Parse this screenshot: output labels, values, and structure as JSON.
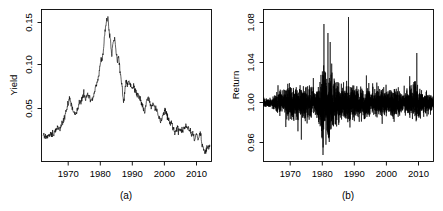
{
  "figure": {
    "background": "#ffffff",
    "line_color": "#000000",
    "panel_count": 2
  },
  "chart_data": [
    {
      "type": "line",
      "panel_id": "a",
      "caption": "(a)",
      "title": "",
      "xlabel": "",
      "ylabel": "Yield",
      "xlim": [
        1961.5,
        2014.5
      ],
      "ylim": [
        0.0145,
        0.1625
      ],
      "xticks": [
        1970,
        1980,
        1990,
        2000,
        2010
      ],
      "xticklabels": [
        "1970",
        "1980",
        "1990",
        "2000",
        "2010"
      ],
      "yticks": [
        0.05,
        0.1,
        0.15
      ],
      "yticklabels": [
        "0.05",
        "0.10",
        "0.15"
      ],
      "grid": false,
      "legend": null,
      "series": [
        {
          "name": "Yield",
          "x": [
            1962.0,
            1962.4,
            1962.8,
            1963.2,
            1963.6,
            1964.0,
            1964.4,
            1964.8,
            1965.2,
            1965.6,
            1966.0,
            1966.3,
            1966.6,
            1966.9,
            1967.2,
            1967.5,
            1967.8,
            1968.1,
            1968.4,
            1968.7,
            1969.0,
            1969.3,
            1969.6,
            1969.9,
            1970.2,
            1970.5,
            1970.8,
            1971.1,
            1971.4,
            1971.7,
            1972.0,
            1972.3,
            1972.6,
            1972.9,
            1973.2,
            1973.5,
            1973.8,
            1974.1,
            1974.4,
            1974.7,
            1975.0,
            1975.3,
            1975.6,
            1975.9,
            1976.2,
            1976.5,
            1976.8,
            1977.1,
            1977.4,
            1977.7,
            1978.0,
            1978.3,
            1978.6,
            1978.9,
            1979.2,
            1979.5,
            1979.8,
            1980.1,
            1980.4,
            1980.7,
            1981.0,
            1981.3,
            1981.6,
            1981.9,
            1982.2,
            1982.5,
            1982.8,
            1983.1,
            1983.4,
            1983.7,
            1984.0,
            1984.3,
            1984.6,
            1984.9,
            1985.2,
            1985.5,
            1985.8,
            1986.1,
            1986.4,
            1986.7,
            1987.0,
            1987.3,
            1987.6,
            1987.9,
            1988.2,
            1988.5,
            1988.8,
            1989.1,
            1989.4,
            1989.7,
            1990.0,
            1990.3,
            1990.6,
            1990.9,
            1991.2,
            1991.5,
            1991.8,
            1992.1,
            1992.4,
            1992.7,
            1993.0,
            1993.3,
            1993.6,
            1993.9,
            1994.2,
            1994.5,
            1994.8,
            1995.1,
            1995.4,
            1995.7,
            1996.0,
            1996.3,
            1996.6,
            1996.9,
            1997.2,
            1997.5,
            1997.8,
            1998.1,
            1998.4,
            1998.7,
            1999.0,
            1999.3,
            1999.6,
            1999.9,
            2000.2,
            2000.5,
            2000.8,
            2001.1,
            2001.4,
            2001.7,
            2002.0,
            2002.3,
            2002.6,
            2002.9,
            2003.2,
            2003.5,
            2003.8,
            2004.1,
            2004.4,
            2004.7,
            2005.0,
            2005.3,
            2005.6,
            2005.9,
            2006.2,
            2006.5,
            2006.8,
            2007.1,
            2007.4,
            2007.7,
            2008.0,
            2008.3,
            2008.6,
            2008.9,
            2009.2,
            2009.5,
            2009.8,
            2010.1,
            2010.4,
            2010.7,
            2011.0,
            2011.3,
            2011.6,
            2011.9,
            2012.2,
            2012.5,
            2012.8,
            2013.1,
            2013.4,
            2013.7,
            2014.0
          ],
          "y": [
            0.0395,
            0.0392,
            0.0398,
            0.039,
            0.0402,
            0.0408,
            0.0415,
            0.0418,
            0.0425,
            0.0432,
            0.0455,
            0.0472,
            0.049,
            0.0478,
            0.0462,
            0.0485,
            0.051,
            0.0528,
            0.0545,
            0.0572,
            0.061,
            0.0648,
            0.068,
            0.0725,
            0.0765,
            0.0742,
            0.0695,
            0.0655,
            0.0618,
            0.0635,
            0.0612,
            0.0625,
            0.064,
            0.0668,
            0.07,
            0.0715,
            0.074,
            0.0755,
            0.079,
            0.08,
            0.0775,
            0.0758,
            0.0782,
            0.0795,
            0.0775,
            0.0755,
            0.0732,
            0.0748,
            0.0755,
            0.0775,
            0.0825,
            0.0868,
            0.0895,
            0.0925,
            0.0958,
            0.1005,
            0.108,
            0.1175,
            0.112,
            0.1198,
            0.132,
            0.1425,
            0.1485,
            0.152,
            0.156,
            0.1448,
            0.1352,
            0.128,
            0.1182,
            0.1275,
            0.1325,
            0.1365,
            0.1245,
            0.1185,
            0.1105,
            0.1165,
            0.109,
            0.0985,
            0.093,
            0.0862,
            0.0725,
            0.0775,
            0.0845,
            0.091,
            0.0885,
            0.0902,
            0.0928,
            0.09,
            0.088,
            0.0855,
            0.087,
            0.0882,
            0.0855,
            0.083,
            0.081,
            0.0795,
            0.0785,
            0.0772,
            0.0758,
            0.0718,
            0.0682,
            0.065,
            0.063,
            0.0672,
            0.072,
            0.0748,
            0.0775,
            0.074,
            0.0695,
            0.066,
            0.068,
            0.07,
            0.0685,
            0.0662,
            0.0672,
            0.0645,
            0.0615,
            0.058,
            0.0552,
            0.0545,
            0.056,
            0.0598,
            0.0622,
            0.0645,
            0.064,
            0.0612,
            0.0585,
            0.055,
            0.0525,
            0.0512,
            0.0535,
            0.05,
            0.0462,
            0.0438,
            0.0418,
            0.0452,
            0.0472,
            0.0458,
            0.044,
            0.0448,
            0.0442,
            0.0452,
            0.0448,
            0.0462,
            0.0475,
            0.049,
            0.0478,
            0.0462,
            0.047,
            0.0455,
            0.0432,
            0.0398,
            0.042,
            0.0382,
            0.0352,
            0.039,
            0.0412,
            0.0385,
            0.0358,
            0.0398,
            0.042,
            0.0362,
            0.03,
            0.0272,
            0.0248,
            0.0228,
            0.025,
            0.0285,
            0.0272,
            0.0305,
            0.029
          ]
        }
      ]
    },
    {
      "type": "line",
      "panel_id": "b",
      "caption": "(b)",
      "title": "",
      "xlabel": "",
      "ylabel": "Return",
      "xlim": [
        1961.5,
        2014.5
      ],
      "ylim": [
        0.9415,
        1.0935
      ],
      "xticks": [
        1970,
        1980,
        1990,
        2000,
        2010
      ],
      "xticklabels": [
        "1970",
        "1980",
        "1990",
        "2000",
        "2010"
      ],
      "yticks": [
        0.96,
        1.0,
        1.04,
        1.08
      ],
      "yticklabels": [
        "0.96",
        "1.00",
        "1.04",
        "1.08"
      ],
      "grid": false,
      "legend": null,
      "description": "High-frequency return series oscillating about 1.00 with volatility clustering; largest bursts near 1980-1984, a single spike near 1988 reaching about 1.086, a downward spike near 1980 reaching about 0.948, and a moderate burst near 2009.",
      "series": [
        {
          "name": "Return",
          "mean": 1.0,
          "volatility_profile": [
            {
              "year": 1962.0,
              "sd": 0.0018
            },
            {
              "year": 1964.0,
              "sd": 0.0022
            },
            {
              "year": 1966.0,
              "sd": 0.005
            },
            {
              "year": 1968.0,
              "sd": 0.0058
            },
            {
              "year": 1970.0,
              "sd": 0.009
            },
            {
              "year": 1971.5,
              "sd": 0.0072
            },
            {
              "year": 1973.0,
              "sd": 0.0062
            },
            {
              "year": 1974.5,
              "sd": 0.0078
            },
            {
              "year": 1976.0,
              "sd": 0.0068
            },
            {
              "year": 1977.5,
              "sd": 0.0058
            },
            {
              "year": 1979.0,
              "sd": 0.009
            },
            {
              "year": 1980.0,
              "sd": 0.02
            },
            {
              "year": 1981.0,
              "sd": 0.0165
            },
            {
              "year": 1982.0,
              "sd": 0.0155
            },
            {
              "year": 1983.0,
              "sd": 0.0115
            },
            {
              "year": 1984.0,
              "sd": 0.0105
            },
            {
              "year": 1985.5,
              "sd": 0.0082
            },
            {
              "year": 1987.0,
              "sd": 0.0078
            },
            {
              "year": 1988.0,
              "sd": 0.0088
            },
            {
              "year": 1990.0,
              "sd": 0.0068
            },
            {
              "year": 1992.0,
              "sd": 0.006
            },
            {
              "year": 1994.0,
              "sd": 0.0072
            },
            {
              "year": 1996.0,
              "sd": 0.006
            },
            {
              "year": 1998.0,
              "sd": 0.0068
            },
            {
              "year": 2000.0,
              "sd": 0.0062
            },
            {
              "year": 2002.0,
              "sd": 0.0072
            },
            {
              "year": 2004.0,
              "sd": 0.0058
            },
            {
              "year": 2006.0,
              "sd": 0.005
            },
            {
              "year": 2008.5,
              "sd": 0.0085
            },
            {
              "year": 2009.5,
              "sd": 0.0078
            },
            {
              "year": 2011.0,
              "sd": 0.0058
            },
            {
              "year": 2013.0,
              "sd": 0.005
            },
            {
              "year": 2014.0,
              "sd": 0.0042
            }
          ],
          "notable_spikes": [
            {
              "year": 1980.05,
              "value": 0.948
            },
            {
              "year": 1980.35,
              "value": 1.079
            },
            {
              "year": 1981.6,
              "value": 1.07
            },
            {
              "year": 1982.3,
              "value": 1.061
            },
            {
              "year": 1988.0,
              "value": 1.086
            },
            {
              "year": 1982.0,
              "value": 0.961
            },
            {
              "year": 2009.3,
              "value": 1.05
            }
          ]
        }
      ]
    }
  ]
}
